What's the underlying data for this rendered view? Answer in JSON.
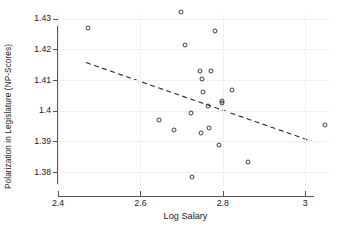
{
  "chart_data": {
    "type": "scatter",
    "title": "",
    "xlabel": "Log Salary",
    "ylabel": "Polarization in Legislature (NP-Scores)",
    "xlim": [
      2.4,
      3.06
    ],
    "ylim": [
      1.3755,
      1.4315
    ],
    "grid": true,
    "legend": null,
    "xticks": [
      "2.4",
      "2.6",
      "2.8",
      "3"
    ],
    "xtick_values": [
      2.4,
      2.6,
      2.8,
      3.0
    ],
    "yticks": [
      "1.43",
      "1.42",
      "1.41",
      "1.4",
      "1.39",
      "1.38"
    ],
    "ytick_values": [
      1.43,
      1.42,
      1.41,
      1.4,
      1.39,
      1.38
    ],
    "marker": "open-circle",
    "marker_color": "#3a3a4a",
    "points": [
      {
        "x": 2.472,
        "y": 1.4268
      },
      {
        "x": 2.699,
        "y": 1.432
      },
      {
        "x": 2.782,
        "y": 1.4261
      },
      {
        "x": 2.708,
        "y": 1.4213
      },
      {
        "x": 2.744,
        "y": 1.4129
      },
      {
        "x": 2.771,
        "y": 1.4129
      },
      {
        "x": 2.749,
        "y": 1.4104
      },
      {
        "x": 2.752,
        "y": 1.406
      },
      {
        "x": 2.823,
        "y": 1.4066
      },
      {
        "x": 2.798,
        "y": 1.4033
      },
      {
        "x": 2.799,
        "y": 1.4026
      },
      {
        "x": 2.763,
        "y": 1.4015
      },
      {
        "x": 2.723,
        "y": 1.3994
      },
      {
        "x": 2.646,
        "y": 1.397
      },
      {
        "x": 2.766,
        "y": 1.3945
      },
      {
        "x": 2.681,
        "y": 1.3936
      },
      {
        "x": 3.047,
        "y": 1.3952
      },
      {
        "x": 2.748,
        "y": 1.3927
      },
      {
        "x": 2.791,
        "y": 1.3888
      },
      {
        "x": 2.86,
        "y": 1.3832
      },
      {
        "x": 2.724,
        "y": 1.3784
      }
    ],
    "trendline": {
      "style": "dashed",
      "color": "#2b2b2b",
      "x_start": 2.468,
      "y_start": 1.4157,
      "x_end": 3.019,
      "y_end": 1.3899
    }
  }
}
